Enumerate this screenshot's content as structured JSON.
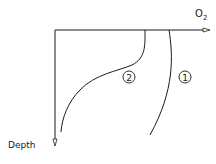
{
  "diagram": {
    "x_axis_label": "O",
    "x_axis_subscript": "2",
    "y_axis_label": "Depth",
    "curves": [
      {
        "id": "1",
        "label": "1",
        "description": "oxygen profile curve 1 (near-uniform, slight decrease with depth)"
      },
      {
        "id": "2",
        "label": "2",
        "description": "oxygen profile curve 2 (sharp decline at mid depth)"
      }
    ],
    "colors": {
      "line": "#1a1a1a",
      "background": "#ffffff"
    }
  }
}
